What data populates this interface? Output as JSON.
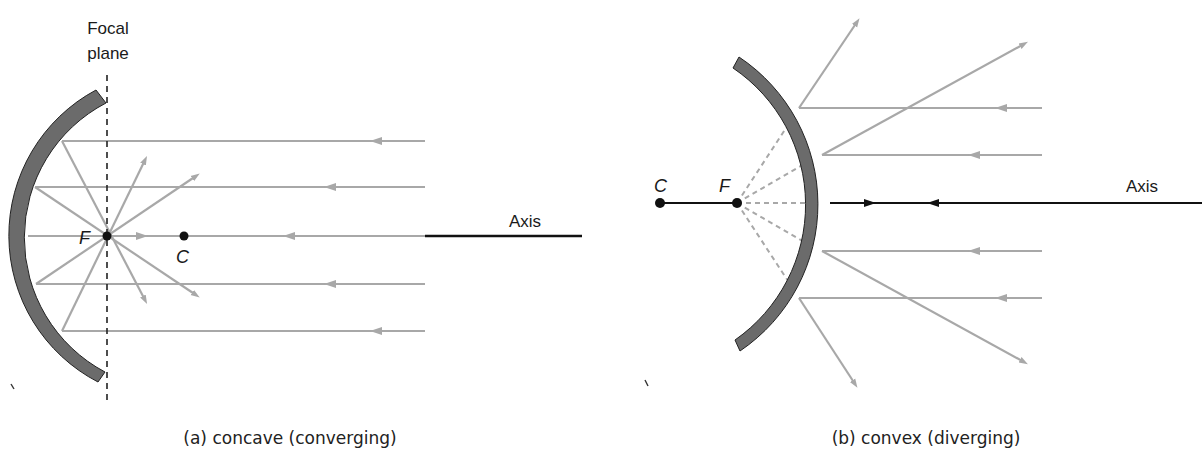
{
  "panel_a": {
    "focal_plane_label_line1": "Focal",
    "focal_plane_label_line2": "plane",
    "focal_point_label": "F",
    "center_label": "C",
    "axis_label": "Axis",
    "caption": "(a) concave (converging)",
    "mirror_type": "concave",
    "ray_count": 5
  },
  "panel_b": {
    "center_label": "C",
    "focal_point_label": "F",
    "axis_label": "Axis",
    "caption": "(b) convex (diverging)",
    "mirror_type": "convex",
    "ray_count": 5
  },
  "colors": {
    "mirror_fill": "#6b6b6b",
    "ray": "#a8a8a8",
    "axis": "#111111",
    "dashed_virtual": "#a8a8a8"
  }
}
